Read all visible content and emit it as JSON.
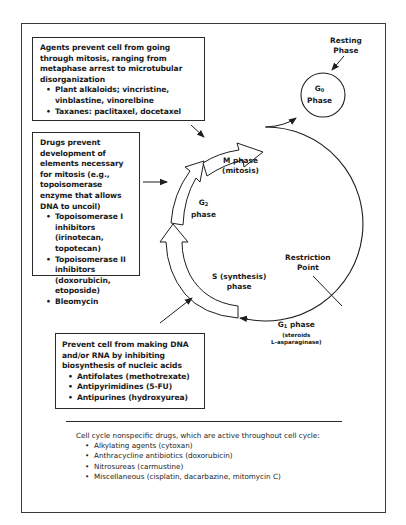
{
  "diagram": {
    "phases": {
      "g0": {
        "line1": "G",
        "sub": "0",
        "line2": "Phase"
      },
      "resting": {
        "line1": "Resting",
        "line2": "Phase"
      },
      "m": {
        "line1": "M phase",
        "line2": "(mitosis)"
      },
      "g2": {
        "line1": "G",
        "sub": "2",
        "line2": "phase"
      },
      "s": {
        "line1": "S (synthesis)",
        "line2": "phase"
      },
      "g1": {
        "line1": "G",
        "sub": "1",
        "line1_rest": " phase",
        "line2": "(steroids",
        "line3": "L-asparaginase)"
      },
      "restriction": {
        "line1": "Restriction",
        "line2": "Point"
      }
    },
    "boxes": {
      "mitosis": {
        "heading": "Agents prevent cell from going through mitosis, ranging from metaphase arrest to microtubular disorganization",
        "items": [
          "Plant alkaloids; vincristine, vinblastine, vinorelbine",
          "Taxanes: paclitaxel, docetaxel"
        ]
      },
      "topoisomerase": {
        "heading": "Drugs prevent development of elements necessary for mitosis (e.g., topoisomerase enzyme that allows DNA to uncoil)",
        "items": [
          "Topoisomerase I inhibitors (irinotecan, topotecan)",
          "Topoisomerase II inhibitors (doxorubicin, etoposide)",
          "Bleomycin"
        ]
      },
      "nucleic": {
        "heading": "Prevent cell from making DNA and/or RNA by inhibiting biosynthesis of nucleic acids",
        "items": [
          "Antifolates (methotrexate)",
          "Antipyrimidines (5-FU)",
          "Antipurines (hydroxyurea)"
        ]
      }
    },
    "nonspecific": {
      "heading": "Cell cycle nonspecific drugs, which are active throughout cell cycle:",
      "items": [
        "Alkylating agents (cytoxan)",
        "Anthracycline antibiotics (doxorubicin)",
        "Nitrosureas (carmustine)",
        "Miscellaneous (cisplatin, dacarbazine, mitomycin C)"
      ]
    },
    "colors": {
      "line": "#1e1e1e",
      "frame": "#3a3a3a",
      "background": "#ffffff"
    }
  }
}
